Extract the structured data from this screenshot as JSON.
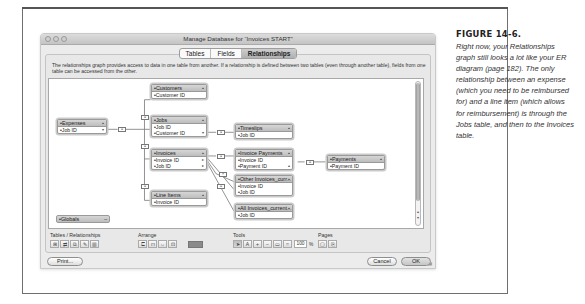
{
  "window": {
    "title": "Manage Database for “Invoices START”",
    "tabs": [
      {
        "label": "Tables",
        "active": false
      },
      {
        "label": "Fields",
        "active": false
      },
      {
        "label": "Relationships",
        "active": true
      }
    ],
    "description": "The relationships graph provides access to data in one table from another. If a relationship is defined between two tables (even through another table), fields from one table can be accessed from the other."
  },
  "graph": {
    "table_occurrences": [
      {
        "id": "customers",
        "name": "Customers",
        "fields": [
          "Customer ID"
        ]
      },
      {
        "id": "expenses",
        "name": "Expenses",
        "fields": [
          "Job ID"
        ]
      },
      {
        "id": "jobs",
        "name": "Jobs",
        "fields": [
          "Job ID",
          "Customer ID"
        ]
      },
      {
        "id": "timeslips",
        "name": "Timeslips",
        "fields": [
          "Job ID"
        ]
      },
      {
        "id": "invoices",
        "name": "Invoices",
        "fields": [
          "Invoice ID",
          "Job ID"
        ]
      },
      {
        "id": "invoice_payments",
        "name": "Invoice Payments",
        "fields": [
          "Invoice ID",
          "Payment ID"
        ]
      },
      {
        "id": "payments",
        "name": "Payments",
        "fields": [
          "Payment ID"
        ]
      },
      {
        "id": "line_items",
        "name": "Line Items",
        "fields": [
          "Invoice ID"
        ]
      },
      {
        "id": "other_invoices",
        "name": "Other Invoices_curr...",
        "fields": [
          "Invoice ID",
          "Job ID"
        ]
      },
      {
        "id": "all_invoices",
        "name": "All Invoices_current...",
        "fields": [
          "Job ID"
        ]
      }
    ],
    "globals": {
      "name": "Globals"
    },
    "relationship_symbol": "=",
    "cross_symbol": "×"
  },
  "toolbar": {
    "tables_relationships_label": "Tables / Relationships",
    "arrange_label": "Arrange",
    "tools_label": "Tools",
    "pages_label": "Pages",
    "zoom_value": "100",
    "zoom_unit": "%",
    "color_swatch": "#8a8a8a"
  },
  "buttons": {
    "print": "Print...",
    "cancel": "Cancel",
    "ok": "OK"
  },
  "caption": {
    "title": "FIGURE 14-6.",
    "body": "Right now, your Relationships graph still looks a lot like your ER diagram (page 182). The only relationship between an expense (which you need to be reimbursed for) and a line item (which allows for reimbursement) is through the Jobs table, and then to the Invoices table."
  }
}
